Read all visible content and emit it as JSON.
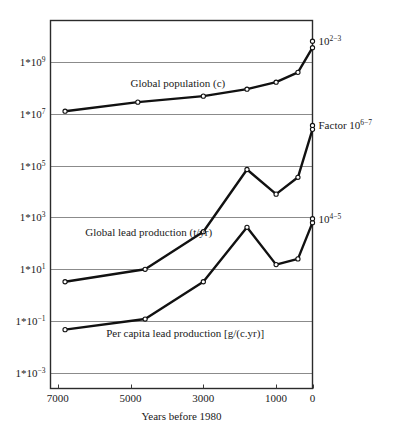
{
  "chart_data": {
    "type": "line",
    "title": "",
    "xlabel": "Years before 1980",
    "ylabel": "",
    "x_axis": {
      "ticks": [
        7000,
        5000,
        3000,
        1000,
        0
      ],
      "tick_labels": [
        "7000",
        "5000",
        "3000",
        "1000",
        "0"
      ],
      "min": 7200,
      "max": 0,
      "reversed": true
    },
    "y_axis": {
      "scale": "log",
      "ticks": [
        9,
        7,
        5,
        3,
        1,
        -1,
        -3
      ],
      "tick_labels": [
        "1*10",
        "1*10",
        "1*10",
        "1*10",
        "1*10",
        "1*10",
        "1*10"
      ],
      "tick_exponents": [
        "9",
        "7",
        "5",
        "3",
        "1",
        "−1",
        "−3"
      ],
      "min_exp": -3.6,
      "max_exp": 10.6,
      "grid": true
    },
    "series": [
      {
        "name": "Global population (c)",
        "label": "Global population (c)",
        "label_x": 3700,
        "label_exp": 8.05,
        "unit": "c",
        "points": [
          {
            "x": 6800,
            "y_exp": 7.1
          },
          {
            "x": 4800,
            "y_exp": 7.45
          },
          {
            "x": 3000,
            "y_exp": 7.68
          },
          {
            "x": 1800,
            "y_exp": 7.95
          },
          {
            "x": 1000,
            "y_exp": 8.22
          },
          {
            "x": 400,
            "y_exp": 8.6
          },
          {
            "x": 0,
            "y_exp": 9.55
          }
        ]
      },
      {
        "name": "Global lead production (t/yr)",
        "label": "Global lead production (t/yr)",
        "label_x": 4500,
        "label_exp": 2.3,
        "unit": "t/yr",
        "points": [
          {
            "x": 6800,
            "y_exp": 0.52
          },
          {
            "x": 4600,
            "y_exp": 1.0
          },
          {
            "x": 3000,
            "y_exp": 2.45
          },
          {
            "x": 1800,
            "y_exp": 4.85
          },
          {
            "x": 1000,
            "y_exp": 3.9
          },
          {
            "x": 400,
            "y_exp": 4.55
          },
          {
            "x": 0,
            "y_exp": 6.4
          }
        ]
      },
      {
        "name": "Per capita lead production [g/(c.yr)]",
        "label": "Per capita lead production [g/(c.yr)]",
        "label_x": 3500,
        "label_exp": -1.62,
        "unit": "g/(c.yr)",
        "points": [
          {
            "x": 6800,
            "y_exp": -1.33
          },
          {
            "x": 4600,
            "y_exp": -0.92
          },
          {
            "x": 3000,
            "y_exp": 0.52
          },
          {
            "x": 1800,
            "y_exp": 2.62
          },
          {
            "x": 1000,
            "y_exp": 1.18
          },
          {
            "x": 400,
            "y_exp": 1.4
          },
          {
            "x": 0,
            "y_exp": 2.8
          }
        ]
      }
    ],
    "annotations": [
      {
        "name": "population-factor",
        "text": "10",
        "exponent": "2−3",
        "x": 0,
        "y_exp": 9.8
      },
      {
        "name": "lead-production-factor",
        "text": "Factor 10",
        "exponent": "6−7",
        "x": 0,
        "y_exp": 6.55
      },
      {
        "name": "per-capita-factor",
        "text": "10",
        "exponent": "4−5",
        "x": 0,
        "y_exp": 2.95
      }
    ],
    "colors": {
      "line": "#111111",
      "grid": "#8b8b8b",
      "frame": "#2b2b2b",
      "marker_fill": "#ffffff",
      "background": "#ffffff",
      "text": "#1a1a1a"
    }
  }
}
